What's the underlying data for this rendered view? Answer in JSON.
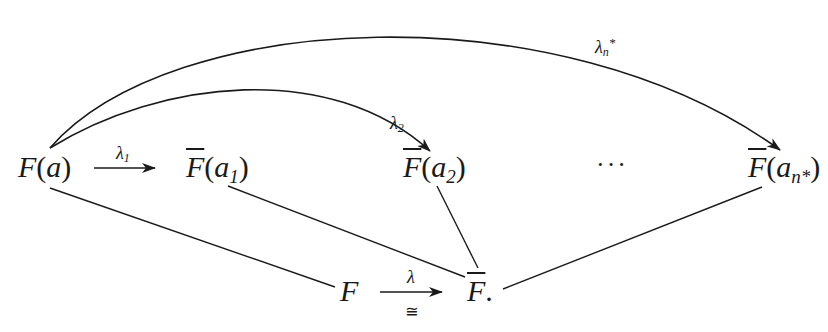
{
  "diagram": {
    "nodes": {
      "Fa": {
        "base": "F",
        "arg": "a",
        "bar": false
      },
      "Fa1": {
        "base": "F",
        "arg": "a",
        "sub": "1",
        "bar": true
      },
      "Fa2": {
        "base": "F",
        "arg": "a",
        "sub": "2",
        "bar": true
      },
      "Fan": {
        "base": "F",
        "arg": "a",
        "sub": "n*",
        "bar": true
      },
      "F": {
        "base": "F",
        "bar": false
      },
      "Fbar": {
        "base": "F",
        "bar": true,
        "suffix": "."
      }
    },
    "text": {
      "open_paren": "(",
      "close_paren": ")",
      "a": "a",
      "F": "F",
      "sub_1": "1",
      "sub_2": "2",
      "sub_nstar": "n*",
      "period": ".",
      "ellipsis": "···",
      "iso": "≅"
    },
    "edge_labels": {
      "lambda1": {
        "symbol": "λ",
        "sub": "1"
      },
      "lambda2": {
        "symbol": "λ",
        "sub": "2"
      },
      "lambda_nstar": {
        "symbol": "λ",
        "sub": "n",
        "sup": "*"
      },
      "lambda": {
        "symbol": "λ",
        "under": "≅"
      }
    },
    "edges": [
      {
        "from": "F(a)",
        "to": "F̄(a₁)",
        "label": "λ₁",
        "style": "arrow"
      },
      {
        "from": "F(a)",
        "to": "F̄(a₂)",
        "label": "λ₂",
        "style": "curved-arrow"
      },
      {
        "from": "F(a)",
        "to": "F̄(aₙ*)",
        "label": "λₙ*",
        "style": "curved-arrow"
      },
      {
        "from": "F",
        "to": "F̄",
        "label": "λ",
        "under": "≅",
        "style": "arrow"
      },
      {
        "from": "F(a)",
        "to": "F",
        "style": "line"
      },
      {
        "from": "F̄(a₁)",
        "to": "F̄",
        "style": "line"
      },
      {
        "from": "F̄(a₂)",
        "to": "F̄",
        "style": "line"
      },
      {
        "from": "F̄(aₙ*)",
        "to": "F̄",
        "style": "line"
      }
    ],
    "colors": {
      "ink": "#1a1a1a",
      "background": "#ffffff"
    }
  }
}
